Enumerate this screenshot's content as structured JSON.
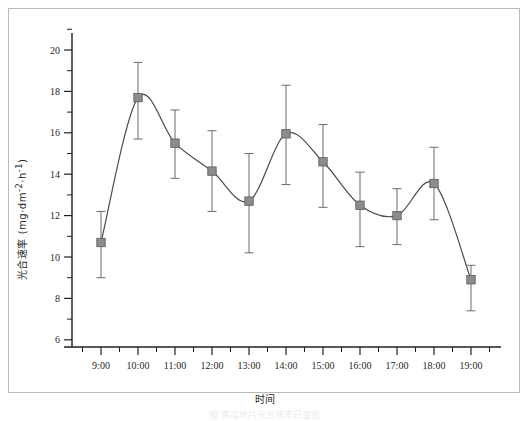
{
  "figure": {
    "caption": "图 黄瓜叶片光合速率日变化"
  },
  "chart_data": {
    "type": "line",
    "title": "",
    "xlabel": "时间",
    "ylabel": "光合速率 (mg·dm-2·h-1)",
    "ylabel_parts": {
      "name": "光合速率",
      "units_open": " (mg·dm",
      "sup1": "-2",
      "mid": "·h",
      "sup2": "-1",
      "units_close": ")"
    },
    "x": [
      "9:00",
      "10:00",
      "11:00",
      "12:00",
      "13:00",
      "14:00",
      "15:00",
      "16:00",
      "17:00",
      "18:00",
      "19:00"
    ],
    "categories": [
      "9:00",
      "10:00",
      "11:00",
      "12:00",
      "13:00",
      "14:00",
      "15:00",
      "16:00",
      "17:00",
      "18:00",
      "19:00"
    ],
    "values": [
      10.7,
      17.7,
      15.5,
      14.15,
      12.7,
      15.95,
      14.6,
      12.5,
      12.0,
      13.55,
      8.9
    ],
    "err_upper": [
      12.2,
      19.4,
      17.1,
      16.1,
      15.0,
      18.3,
      16.4,
      14.1,
      13.3,
      15.3,
      9.6
    ],
    "err_lower": [
      9.0,
      15.7,
      13.8,
      12.2,
      10.2,
      13.5,
      12.4,
      10.5,
      10.6,
      11.8,
      7.4
    ],
    "ylim": [
      6,
      21
    ],
    "yticks": [
      6,
      8,
      10,
      12,
      14,
      16,
      18,
      20
    ],
    "ytick_labels": [
      "6",
      "8",
      "10",
      "12",
      "14",
      "16",
      "18",
      "20"
    ],
    "y_minor_ticks": [
      7,
      9,
      11,
      13,
      15,
      17,
      19,
      21
    ],
    "xlim": [
      "8:30",
      "19:45"
    ],
    "grid": false,
    "legend": null,
    "series_name": "光合速率",
    "marker": "filled-square",
    "marker_color": "#8c8c8c",
    "marker_edge_color": "#5a5a5a",
    "line_color": "#4a4a4a",
    "errorbar_color": "#6b6b6b",
    "axis_color": "#1f1f1f"
  }
}
